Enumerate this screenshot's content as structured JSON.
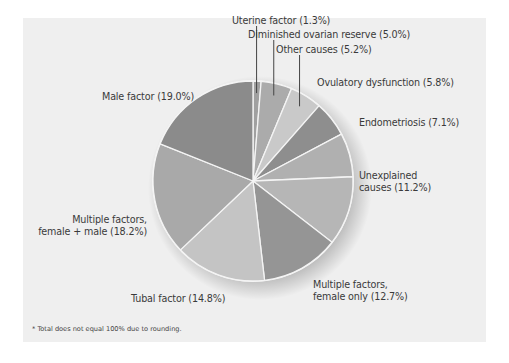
{
  "chart_data": {
    "type": "pie",
    "title": "",
    "start_angle_deg": 0,
    "direction": "clockwise",
    "slices": [
      {
        "label": "Uterine factor",
        "value": 1.3,
        "display": "Uterine factor (1.3%)",
        "color": "#a0a0a0"
      },
      {
        "label": "Diminished ovarian reserve",
        "value": 5.0,
        "display": "Diminished ovarian reserve (5.0%)",
        "color": "#ababab"
      },
      {
        "label": "Other causes",
        "value": 5.2,
        "display": "Other causes (5.2%)",
        "color": "#c9c9c9"
      },
      {
        "label": "Ovulatory dysfunction",
        "value": 5.8,
        "display": "Ovulatory dysfunction (5.8%)",
        "color": "#8e8e8e"
      },
      {
        "label": "Endometriosis",
        "value": 7.1,
        "display": "Endometriosis (7.1%)",
        "color": "#b0b0b0"
      },
      {
        "label": "Unexplained causes",
        "value": 11.2,
        "display": "Unexplained causes (11.2%)",
        "color": "#b6b6b6"
      },
      {
        "label": "Multiple factors, female only",
        "value": 12.7,
        "display": "Multiple factors, female only (12.7%)",
        "color": "#959595"
      },
      {
        "label": "Tubal factor",
        "value": 14.8,
        "display": "Tubal factor (14.8%)",
        "color": "#c4c4c4"
      },
      {
        "label": "Multiple factors, female + male",
        "value": 18.2,
        "display": "Multiple factors, female + male (18.2%)",
        "color": "#a9a9a9"
      },
      {
        "label": "Male factor",
        "value": 19.0,
        "display": "Male factor (19.0%)",
        "color": "#8b8b8b"
      }
    ],
    "footnote": "* Total does not equal 100% due to rounding.",
    "legend": "none (direct labels)"
  },
  "labels": {
    "uterine": "Uterine factor (1.3%)",
    "diminished": "Diminished ovarian reserve (5.0%)",
    "other": "Other causes (5.2%)",
    "ovulatory": "Ovulatory dysfunction (5.8%)",
    "endometriosis": "Endometriosis (7.1%)",
    "unexplained_1": "Unexplained",
    "unexplained_2": "causes (11.2%)",
    "female_only_1": "Multiple factors,",
    "female_only_2": "female only (12.7%)",
    "tubal": "Tubal factor (14.8%)",
    "female_male_1": "Multiple factors,",
    "female_male_2": "female + male (18.2%)",
    "male": "Male factor (19.0%)"
  },
  "footnote": "* Total does not equal 100% due to rounding.",
  "colors": {
    "panel_bg": "#efefef",
    "slice_border": "#f4f4f4",
    "leader_line": "#444444"
  }
}
